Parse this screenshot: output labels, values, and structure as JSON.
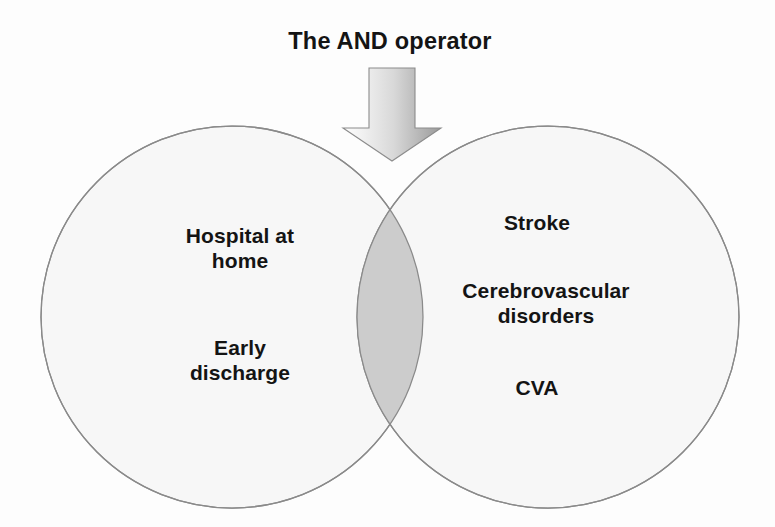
{
  "diagram": {
    "title": "The AND operator",
    "type": "venn-two-set",
    "background_color": "#fdfdfd",
    "arrow": {
      "name": "down-arrow",
      "direction": "down",
      "gradient_from": "#fdfdfd",
      "gradient_to": "#9a9a9a",
      "outline_color": "#8c8c8c"
    },
    "sets": [
      {
        "id": "left",
        "name": "hospital-at-home-set",
        "fill_color": "#f7f7f7",
        "stroke_color": "#8a8a8a",
        "center_x": 232,
        "center_y": 317,
        "radius": 191,
        "labels": [
          "Hospital at\nhome",
          "Early\ndischarge"
        ]
      },
      {
        "id": "right",
        "name": "stroke-set",
        "fill_color": "#f7f7f7",
        "stroke_color": "#8a8a8a",
        "center_x": 548,
        "center_y": 317,
        "radius": 191,
        "labels": [
          "Stroke",
          "Cerebrovascular\ndisorders",
          "CVA"
        ]
      }
    ],
    "intersection": {
      "name": "and-intersection-lens",
      "fill_color": "#cccccc",
      "stroke_color": "#8a8a8a",
      "label": ""
    }
  }
}
